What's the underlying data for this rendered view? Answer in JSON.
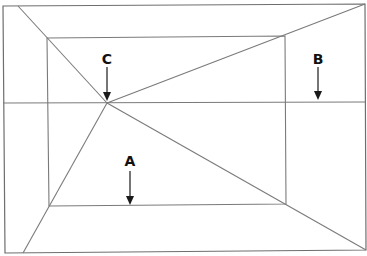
{
  "diagram": {
    "title": "",
    "labels": [
      {
        "id": "A",
        "text": "A",
        "x": 130,
        "y": 166,
        "arrow_from": [
          130,
          170
        ],
        "arrow_to": [
          130,
          205
        ]
      },
      {
        "id": "B",
        "text": "B",
        "x": 318,
        "y": 64,
        "arrow_from": [
          318,
          67
        ],
        "arrow_to": [
          318,
          100
        ]
      },
      {
        "id": "C",
        "text": "C",
        "x": 107,
        "y": 64,
        "arrow_from": [
          107,
          67
        ],
        "arrow_to": [
          107,
          100
        ]
      }
    ],
    "outer_frame": {
      "tl": [
        3,
        6
      ],
      "tr": [
        365,
        4
      ],
      "br": [
        366,
        250
      ],
      "bl": [
        5,
        253
      ]
    },
    "inner_rect": {
      "tl": [
        47,
        38
      ],
      "tr": [
        285,
        36
      ],
      "br": [
        286,
        204
      ],
      "bl": [
        49,
        206
      ]
    },
    "horizon_y": 103,
    "vanishing_point": [
      107,
      103
    ],
    "colors": {
      "line": "#7a7a7a",
      "arrow": "#1a1a1a",
      "background": "#ffffff"
    }
  }
}
